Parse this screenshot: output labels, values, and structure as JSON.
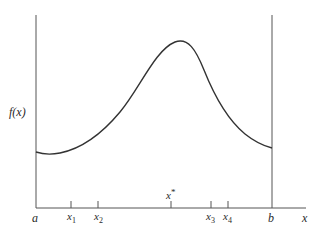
{
  "diagram": {
    "type": "function-plot",
    "y_axis_label": "f(x)",
    "x_axis_label": "x",
    "interval": {
      "left": "a",
      "right": "b"
    },
    "maximum_label": "x*",
    "points": [
      {
        "name": "x1",
        "base": "x",
        "subscript": "1"
      },
      {
        "name": "x2",
        "base": "x",
        "subscript": "2"
      },
      {
        "name": "x3",
        "base": "x",
        "subscript": "3"
      },
      {
        "name": "x4",
        "base": "x",
        "subscript": "4"
      }
    ]
  },
  "labels": {
    "fx": "f(x)",
    "a": "a",
    "b": "b",
    "x": "x",
    "xstar_base": "x",
    "xstar_sup": "*",
    "x1_base": "x",
    "x1_sub": "1",
    "x2_base": "x",
    "x2_sub": "2",
    "x3_base": "x",
    "x3_sub": "3",
    "x4_base": "x",
    "x4_sub": "4"
  },
  "colors": {
    "curve": "#333333",
    "axes": "#555555",
    "background": "#ffffff"
  }
}
